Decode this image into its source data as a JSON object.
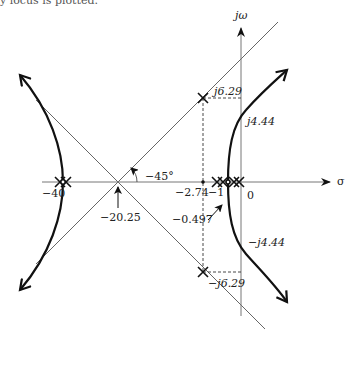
{
  "caption": "y locus is plotted.",
  "axes": {
    "real_label": "σ",
    "imag_label": "jω",
    "origin_label": "0"
  },
  "asymptotes": {
    "centroid_label": "−20.25",
    "angle_label": "−45°"
  },
  "labels": {
    "pole_minus40": "−40",
    "breakaway": "−2.74",
    "pole_minus1": "−1",
    "zero_or_pole": "−0.497",
    "pos_j629": "j6.29",
    "neg_j629": "−j6.29",
    "pos_j444": "j4.44",
    "neg_j444": "−j4.44"
  },
  "colors": {
    "axis": "#777777",
    "locus": "#111111",
    "asymptote": "#666666",
    "text": "#222222"
  }
}
